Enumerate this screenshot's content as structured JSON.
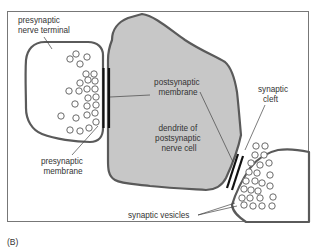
{
  "figure": {
    "panel_label": "(B)",
    "colors": {
      "frame": "#666666",
      "cell_outline": "#5a5a5a",
      "dendrite_fill": "#c7c7c7",
      "terminal_fill": "#ffffff",
      "membrane": "#111111",
      "vesicle": "#6a6a6a",
      "text": "#333333"
    },
    "labels": {
      "presynaptic_terminal": [
        "presynaptic",
        "nerve terminal"
      ],
      "postsynaptic_membrane": [
        "postsynaptic",
        "membrane"
      ],
      "synaptic_cleft": [
        "synaptic",
        "cleft"
      ],
      "dendrite": [
        "dendrite of",
        "postsynaptic",
        "nerve cell"
      ],
      "presynaptic_membrane": [
        "presynaptic",
        "membrane"
      ],
      "synaptic_vesicles": "synaptic vesicles"
    }
  }
}
